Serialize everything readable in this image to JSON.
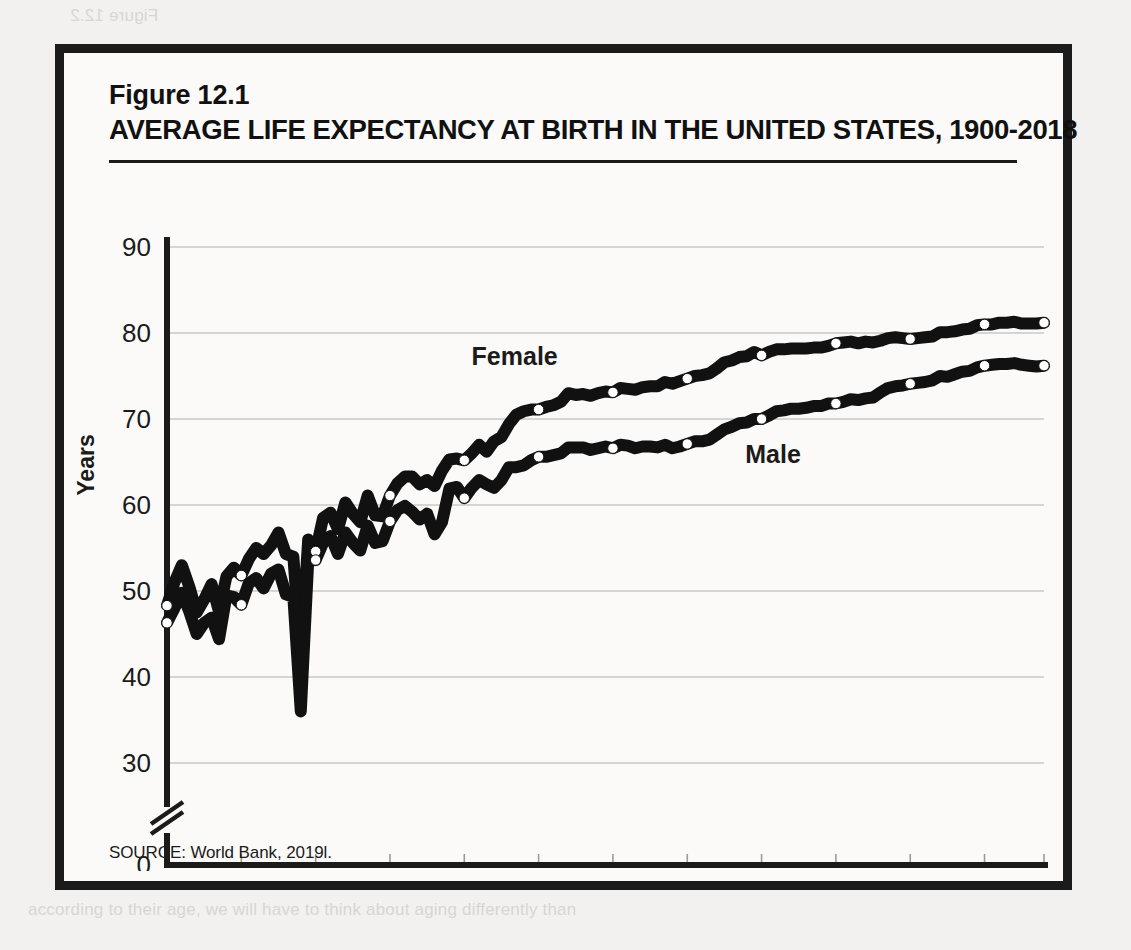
{
  "figure": {
    "number": "Figure 12.1",
    "title": "AVERAGE LIFE EXPECTANCY AT BIRTH IN THE UNITED STATES, 1900-2018",
    "source": "SOURCE: World Bank, 2019l."
  },
  "bleed_text": {
    "top": "Figure 12.2",
    "bottom": "according to their age, we will have to think about aging differently than"
  },
  "colors": {
    "ink": "#1b1b1b",
    "line": "#111111",
    "marker_fill": "#ffffff",
    "gridline": "#c9c9c9",
    "page": "#f2f1ef",
    "figure_bg": "#fbfaf8"
  },
  "chart_data": {
    "type": "line",
    "title": "AVERAGE LIFE EXPECTANCY AT BIRTH IN THE UNITED STATES, 1900-2018",
    "xlabel": "",
    "ylabel": "Years",
    "xlim": [
      1900,
      2018
    ],
    "ylim": [
      30,
      90
    ],
    "y_axis_break": true,
    "y_axis_break_between": [
      0,
      30
    ],
    "grid": "horizontal",
    "legend_position": "inline-labels",
    "ytick_labels": [
      "0",
      "30",
      "40",
      "50",
      "60",
      "70",
      "80",
      "90"
    ],
    "yticks": [
      0,
      30,
      40,
      50,
      60,
      70,
      80,
      90
    ],
    "xtick_labels": [
      "1900",
      "1910",
      "1920",
      "1930",
      "1940",
      "1950",
      "1960",
      "1970",
      "1980",
      "1990",
      "2000",
      "2010",
      "2018"
    ],
    "xticks": [
      1900,
      1910,
      1920,
      1930,
      1940,
      1950,
      1960,
      1970,
      1980,
      1990,
      2000,
      2010,
      2018
    ],
    "marker_years": [
      1900,
      1910,
      1920,
      1930,
      1940,
      1950,
      1960,
      1970,
      1980,
      1990,
      2000,
      2010,
      2018
    ],
    "x": [
      1900,
      1901,
      1902,
      1903,
      1904,
      1905,
      1906,
      1907,
      1908,
      1909,
      1910,
      1911,
      1912,
      1913,
      1914,
      1915,
      1916,
      1917,
      1918,
      1919,
      1920,
      1921,
      1922,
      1923,
      1924,
      1925,
      1926,
      1927,
      1928,
      1929,
      1930,
      1931,
      1932,
      1933,
      1934,
      1935,
      1936,
      1937,
      1938,
      1939,
      1940,
      1941,
      1942,
      1943,
      1944,
      1945,
      1946,
      1947,
      1948,
      1949,
      1950,
      1951,
      1952,
      1953,
      1954,
      1955,
      1956,
      1957,
      1958,
      1959,
      1960,
      1961,
      1962,
      1963,
      1964,
      1965,
      1966,
      1967,
      1968,
      1969,
      1970,
      1971,
      1972,
      1973,
      1974,
      1975,
      1976,
      1977,
      1978,
      1979,
      1980,
      1981,
      1982,
      1983,
      1984,
      1985,
      1986,
      1987,
      1988,
      1989,
      1990,
      1991,
      1992,
      1993,
      1994,
      1995,
      1996,
      1997,
      1998,
      1999,
      2000,
      2001,
      2002,
      2003,
      2004,
      2005,
      2006,
      2007,
      2008,
      2009,
      2010,
      2011,
      2012,
      2013,
      2014,
      2015,
      2016,
      2017,
      2018
    ],
    "series": [
      {
        "name": "Female",
        "label": "Female",
        "values": [
          48.3,
          51.0,
          53.0,
          50.5,
          47.5,
          49.0,
          50.8,
          47.6,
          51.7,
          52.7,
          51.8,
          53.7,
          55.0,
          54.3,
          55.3,
          56.8,
          54.3,
          54.0,
          42.2,
          56.0,
          54.6,
          58.5,
          59.1,
          57.2,
          60.3,
          59.0,
          58.0,
          61.1,
          58.8,
          58.7,
          61.1,
          62.5,
          63.3,
          63.3,
          62.4,
          62.9,
          62.2,
          64.0,
          65.3,
          65.4,
          65.2,
          66.0,
          67.0,
          66.2,
          67.4,
          67.9,
          69.4,
          70.5,
          70.9,
          71.1,
          71.1,
          71.4,
          71.6,
          72.0,
          73.0,
          72.8,
          72.9,
          72.7,
          73.0,
          73.2,
          73.1,
          73.6,
          73.5,
          73.4,
          73.7,
          73.8,
          73.8,
          74.3,
          74.1,
          74.4,
          74.7,
          75.0,
          75.1,
          75.3,
          75.9,
          76.6,
          76.8,
          77.2,
          77.3,
          77.8,
          77.4,
          77.8,
          78.1,
          78.1,
          78.2,
          78.2,
          78.2,
          78.3,
          78.3,
          78.5,
          78.8,
          78.9,
          79.0,
          78.8,
          79.0,
          78.9,
          79.1,
          79.4,
          79.5,
          79.4,
          79.3,
          79.4,
          79.5,
          79.6,
          80.1,
          80.1,
          80.2,
          80.4,
          80.5,
          80.9,
          81.0,
          81.0,
          81.2,
          81.2,
          81.3,
          81.1,
          81.1,
          81.1,
          81.2
        ]
      },
      {
        "name": "Male",
        "label": "Male",
        "values": [
          46.3,
          48.0,
          49.8,
          47.6,
          45.0,
          46.3,
          46.9,
          44.4,
          49.5,
          49.3,
          48.4,
          50.9,
          51.5,
          50.3,
          52.0,
          52.5,
          49.6,
          49.3,
          36.0,
          53.5,
          53.6,
          55.6,
          56.4,
          54.3,
          56.8,
          55.6,
          54.7,
          57.6,
          55.6,
          55.8,
          58.1,
          59.4,
          59.9,
          59.2,
          58.3,
          59.0,
          56.6,
          58.0,
          61.9,
          62.1,
          60.8,
          62.0,
          62.9,
          62.4,
          62.0,
          62.9,
          64.4,
          64.4,
          64.6,
          65.2,
          65.6,
          65.6,
          65.8,
          66.0,
          66.7,
          66.7,
          66.7,
          66.4,
          66.6,
          66.8,
          66.6,
          67.0,
          66.9,
          66.6,
          66.8,
          66.8,
          66.7,
          67.0,
          66.6,
          66.8,
          67.1,
          67.4,
          67.4,
          67.6,
          68.2,
          68.8,
          69.1,
          69.5,
          69.6,
          70.0,
          70.0,
          70.4,
          70.9,
          71.0,
          71.2,
          71.2,
          71.3,
          71.5,
          71.5,
          71.8,
          71.8,
          72.0,
          72.3,
          72.2,
          72.4,
          72.5,
          73.1,
          73.6,
          73.8,
          73.9,
          74.1,
          74.2,
          74.3,
          74.5,
          75.0,
          74.9,
          75.2,
          75.5,
          75.6,
          76.0,
          76.2,
          76.3,
          76.4,
          76.4,
          76.5,
          76.3,
          76.2,
          76.1,
          76.2
        ]
      }
    ]
  }
}
